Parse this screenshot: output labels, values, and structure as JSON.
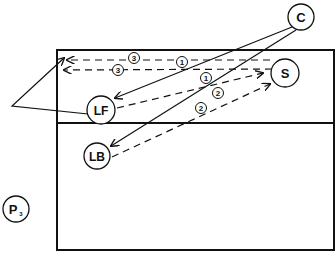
{
  "diagram": {
    "type": "volleyball-play-diagram",
    "colors": {
      "ink": "#111111",
      "background": "#ffffff"
    },
    "court": {
      "x": 57,
      "y": 50,
      "width": 277,
      "height": 200,
      "divider_y": 123
    },
    "players": [
      {
        "id": "C",
        "label": "C",
        "sub": "",
        "cx": 301,
        "cy": 17,
        "r": 13
      },
      {
        "id": "S",
        "label": "S",
        "sub": "",
        "cx": 285,
        "cy": 73,
        "r": 14
      },
      {
        "id": "LF",
        "label": "LF",
        "sub": "",
        "cx": 101,
        "cy": 110,
        "r": 14
      },
      {
        "id": "LB",
        "label": "LB",
        "sub": "",
        "cx": 97,
        "cy": 156,
        "r": 13
      },
      {
        "id": "P3",
        "label": "P",
        "sub": "3",
        "cx": 16,
        "cy": 209,
        "r": 13
      }
    ],
    "sequence_markers": [
      {
        "label": "3",
        "cx": 134,
        "cy": 58
      },
      {
        "label": "3",
        "cx": 118,
        "cy": 70
      },
      {
        "label": "1",
        "cx": 182,
        "cy": 62
      },
      {
        "label": "1",
        "cx": 206,
        "cy": 78
      },
      {
        "label": "2",
        "cx": 218,
        "cy": 93
      },
      {
        "label": "2",
        "cx": 201,
        "cy": 108
      }
    ],
    "paths": [
      {
        "from": "C",
        "to": "LF",
        "style": "solid",
        "marker": "arrow",
        "step": "1"
      },
      {
        "from": "C",
        "to": "LB",
        "style": "solid",
        "marker": "arrow",
        "step": "1"
      },
      {
        "from": "LF",
        "to": "S",
        "style": "dashed",
        "marker": "arrow",
        "step": "2"
      },
      {
        "from": "LB",
        "to": "S",
        "style": "dashed",
        "marker": "arrow",
        "step": "2"
      },
      {
        "from": "S",
        "to": "left-court",
        "style": "dashed",
        "marker": "arrow",
        "step": "3"
      },
      {
        "from": "S",
        "to": "left-court",
        "style": "dashed",
        "marker": "arrow",
        "step": "3"
      },
      {
        "from": "LF",
        "to": "left-corner",
        "style": "solid",
        "marker": "arrow",
        "step": ""
      }
    ]
  }
}
